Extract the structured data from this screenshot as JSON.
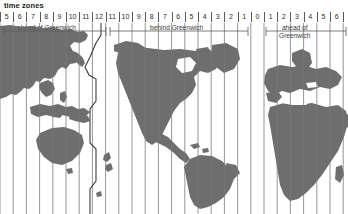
{
  "title": "time zones",
  "labels": {
    "left": "ahead of Greenwich",
    "center": "behind Greenwich",
    "right_line1": "ahead of",
    "right_line2": "Greenwich"
  },
  "scale": {
    "zone_width": 13.2,
    "numbers": [
      "5",
      "6",
      "7",
      "8",
      "9",
      "10",
      "11",
      "12",
      "11",
      "10",
      "9",
      "8",
      "7",
      "6",
      "5",
      "4",
      "3",
      "2",
      "1",
      "0",
      "1",
      "2",
      "3",
      "4",
      "5",
      "6"
    ]
  },
  "chart_data": {
    "type": "map",
    "title": "time zones",
    "projection": "cylindrical, centred on the Americas",
    "xlabel": "hours offset from Greenwich Mean Time",
    "zone_offsets": [
      "+5",
      "+6",
      "+7",
      "+8",
      "+9",
      "+10",
      "+11",
      "+12",
      "-11",
      "-10",
      "-9",
      "-8",
      "-7",
      "-6",
      "-5",
      "-4",
      "-3",
      "-2",
      "-1",
      "0",
      "+1",
      "+2",
      "+3",
      "+4",
      "+5",
      "+6"
    ],
    "zone_count": 26,
    "groups": [
      {
        "label": "ahead of Greenwich",
        "offsets": [
          "+5",
          "+6",
          "+7",
          "+8",
          "+9",
          "+10",
          "+11",
          "+12"
        ]
      },
      {
        "label": "behind Greenwich",
        "offsets": [
          "-11",
          "-10",
          "-9",
          "-8",
          "-7",
          "-6",
          "-5",
          "-4",
          "-3",
          "-2",
          "-1"
        ]
      },
      {
        "label": "Greenwich",
        "offsets": [
          "0"
        ]
      },
      {
        "label": "ahead of Greenwich",
        "offsets": [
          "+1",
          "+2",
          "+3",
          "+4",
          "+5",
          "+6"
        ]
      }
    ],
    "features": [
      "international date line",
      "land masses shaded",
      "vertical hour-zone boundary lines"
    ],
    "colors": {
      "land": "#6e6e6e",
      "ocean": "#ffffff",
      "gridline": "#7a7a7a",
      "text": "#2b2b2b"
    }
  },
  "colors": {
    "land": "#6e6e6e",
    "ocean": "#ffffff",
    "gridline": "#7a7a7a",
    "dateline": "#3c3c3c",
    "text": "#2b2b2b"
  }
}
